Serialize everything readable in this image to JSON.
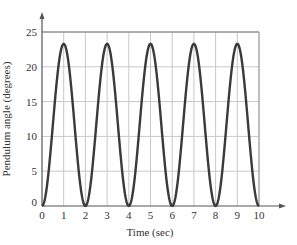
{
  "chart_data": {
    "type": "line",
    "title": "",
    "xlabel": "Time (sec)",
    "ylabel": "Pendulum angle (degrees)",
    "xlim": [
      0,
      10
    ],
    "ylim": [
      0,
      25
    ],
    "xticks": [
      0,
      1,
      2,
      3,
      4,
      5,
      6,
      7,
      8,
      9,
      10
    ],
    "yticks": [
      0,
      5,
      10,
      15,
      20,
      25
    ],
    "grid": true,
    "legend": null,
    "series": [
      {
        "name": "Pendulum angle",
        "color": "#3a3a3a",
        "x": [
          0,
          0.5,
          1,
          1.5,
          2,
          2.5,
          3,
          3.5,
          4,
          4.5,
          5,
          5.5,
          6,
          6.5,
          7,
          7.5,
          8,
          8.5,
          9,
          9.5,
          10
        ],
        "y": [
          0,
          11.65,
          23.3,
          11.65,
          0,
          11.65,
          23.3,
          11.65,
          0,
          11.65,
          23.3,
          11.65,
          0,
          11.65,
          23.3,
          11.65,
          0,
          11.65,
          23.3,
          11.65,
          0
        ]
      }
    ],
    "peaks": [
      {
        "x": 1,
        "y": 23.3
      },
      {
        "x": 3,
        "y": 23.3
      },
      {
        "x": 5,
        "y": 23.3
      },
      {
        "x": 7,
        "y": 23.3
      },
      {
        "x": 9,
        "y": 23.3
      }
    ],
    "amplitude": 23.3,
    "period": 2
  },
  "colors": {
    "curve": "#3a3a3a",
    "grid": "#c8c8c8",
    "axis": "#555555",
    "text": "#333333"
  }
}
